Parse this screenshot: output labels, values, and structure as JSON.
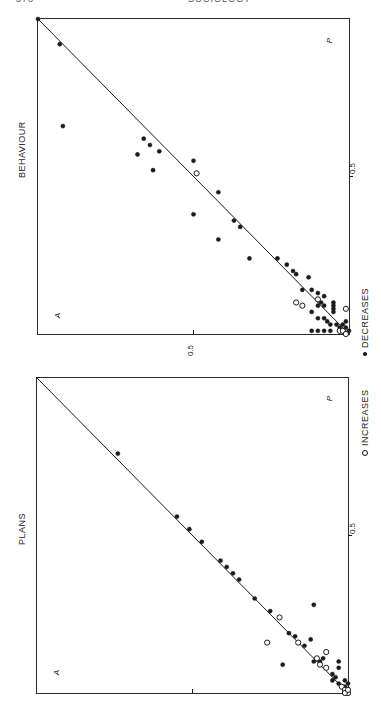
{
  "page": {
    "number": "378",
    "running_head": "SOCIOLOGY"
  },
  "legend": {
    "increases_label": "INCREASES",
    "decreases_label": "DECREASES"
  },
  "plots": {
    "behaviour": {
      "title": "BEHAVIOUR",
      "x_axis_letter": "A",
      "y_axis_letter": "P",
      "tick_label_x": "0.5",
      "tick_label_y": "0.5"
    },
    "plans": {
      "title": "PLANS",
      "x_axis_letter": "A",
      "y_axis_letter": "P",
      "tick_label_y": "0.5"
    }
  },
  "colors": {
    "ink": "#1a1a1a",
    "frame": "#2a2a2a",
    "background": "#ffffff"
  },
  "chart_data": [
    {
      "type": "scatter",
      "title": "BEHAVIOUR",
      "xlabel": "A",
      "ylabel": "P",
      "xlim": [
        0,
        1
      ],
      "ylim": [
        0,
        1
      ],
      "grid": false,
      "reference_line": {
        "from": [
          0,
          0
        ],
        "to": [
          1,
          1
        ],
        "label": "A = P"
      },
      "ticks": {
        "x": [
          0.5
        ],
        "y": [
          0.5
        ]
      },
      "legend_position": "bottom",
      "series": [
        {
          "name": "Decreases",
          "marker": "filled-circle",
          "points": [
            [
              1.0,
              1.0
            ],
            [
              0.93,
              0.92
            ],
            [
              0.92,
              0.66
            ],
            [
              0.66,
              0.62
            ],
            [
              0.64,
              0.6
            ],
            [
              0.61,
              0.58
            ],
            [
              0.68,
              0.57
            ],
            [
              0.63,
              0.52
            ],
            [
              0.5,
              0.55
            ],
            [
              0.5,
              0.38
            ],
            [
              0.42,
              0.45
            ],
            [
              0.42,
              0.3
            ],
            [
              0.37,
              0.36
            ],
            [
              0.35,
              0.34
            ],
            [
              0.32,
              0.24
            ],
            [
              0.23,
              0.24
            ],
            [
              0.2,
              0.22
            ],
            [
              0.18,
              0.2
            ],
            [
              0.17,
              0.19
            ],
            [
              0.13,
              0.18
            ],
            [
              0.15,
              0.14
            ],
            [
              0.12,
              0.14
            ],
            [
              0.1,
              0.13
            ],
            [
              0.08,
              0.12
            ],
            [
              0.09,
              0.1
            ],
            [
              0.1,
              0.09
            ],
            [
              0.08,
              0.09
            ],
            [
              0.05,
              0.1
            ],
            [
              0.05,
              0.09
            ],
            [
              0.05,
              0.08
            ],
            [
              0.05,
              0.07
            ],
            [
              0.12,
              0.07
            ],
            [
              0.1,
              0.05
            ],
            [
              0.08,
              0.05
            ],
            [
              0.07,
              0.04
            ],
            [
              0.06,
              0.03
            ],
            [
              0.04,
              0.03
            ],
            [
              0.03,
              0.02
            ],
            [
              0.02,
              0.03
            ],
            [
              0.01,
              0.04
            ],
            [
              0.01,
              0.02
            ],
            [
              0.12,
              0.01
            ],
            [
              0.1,
              0.01
            ],
            [
              0.08,
              0.01
            ],
            [
              0.06,
              0.01
            ],
            [
              0.0,
              0.01
            ]
          ]
        },
        {
          "name": "Increases",
          "marker": "open-circle",
          "points": [
            [
              0.49,
              0.51
            ],
            [
              0.17,
              0.1
            ],
            [
              0.15,
              0.09
            ],
            [
              0.1,
              0.11
            ],
            [
              0.01,
              0.08
            ],
            [
              0.03,
              0.01
            ],
            [
              0.02,
              0.01
            ],
            [
              0.01,
              0.0
            ]
          ]
        }
      ]
    },
    {
      "type": "scatter",
      "title": "PLANS",
      "xlabel": "A",
      "ylabel": "P",
      "xlim": [
        0,
        1
      ],
      "ylim": [
        0,
        1
      ],
      "grid": false,
      "reference_line": {
        "from": [
          0,
          0
        ],
        "to": [
          1,
          1
        ],
        "label": "A = P"
      },
      "ticks": {
        "x": [
          0.5
        ],
        "y": [
          0.5
        ]
      },
      "legend_position": "bottom",
      "series": [
        {
          "name": "Decreases",
          "marker": "filled-circle",
          "points": [
            [
              0.74,
              0.76
            ],
            [
              0.55,
              0.56
            ],
            [
              0.51,
              0.52
            ],
            [
              0.47,
              0.48
            ],
            [
              0.41,
              0.42
            ],
            [
              0.39,
              0.4
            ],
            [
              0.37,
              0.38
            ],
            [
              0.35,
              0.36
            ],
            [
              0.3,
              0.3
            ],
            [
              0.25,
              0.26
            ],
            [
              0.19,
              0.19
            ],
            [
              0.17,
              0.18
            ],
            [
              0.14,
              0.15
            ],
            [
              0.11,
              0.28
            ],
            [
              0.12,
              0.17
            ],
            [
              0.21,
              0.09
            ],
            [
              0.11,
              0.1
            ],
            [
              0.09,
              0.1
            ],
            [
              0.08,
              0.11
            ],
            [
              0.03,
              0.1
            ],
            [
              0.03,
              0.08
            ],
            [
              0.05,
              0.06
            ],
            [
              0.04,
              0.05
            ],
            [
              0.05,
              0.04
            ],
            [
              0.03,
              0.03
            ],
            [
              0.01,
              0.04
            ],
            [
              0.02,
              0.02
            ],
            [
              0.01,
              0.02
            ],
            [
              0.0,
              0.03
            ]
          ]
        },
        {
          "name": "Increases",
          "marker": "open-circle",
          "points": [
            [
              0.22,
              0.24
            ],
            [
              0.26,
              0.16
            ],
            [
              0.16,
              0.16
            ],
            [
              0.07,
              0.13
            ],
            [
              0.1,
              0.11
            ],
            [
              0.09,
              0.09
            ],
            [
              0.07,
              0.08
            ],
            [
              0.02,
              0.02
            ],
            [
              0.01,
              0.01
            ],
            [
              0.0,
              0.0
            ],
            [
              0.01,
              0.0
            ],
            [
              0.0,
              0.01
            ]
          ]
        }
      ]
    }
  ]
}
